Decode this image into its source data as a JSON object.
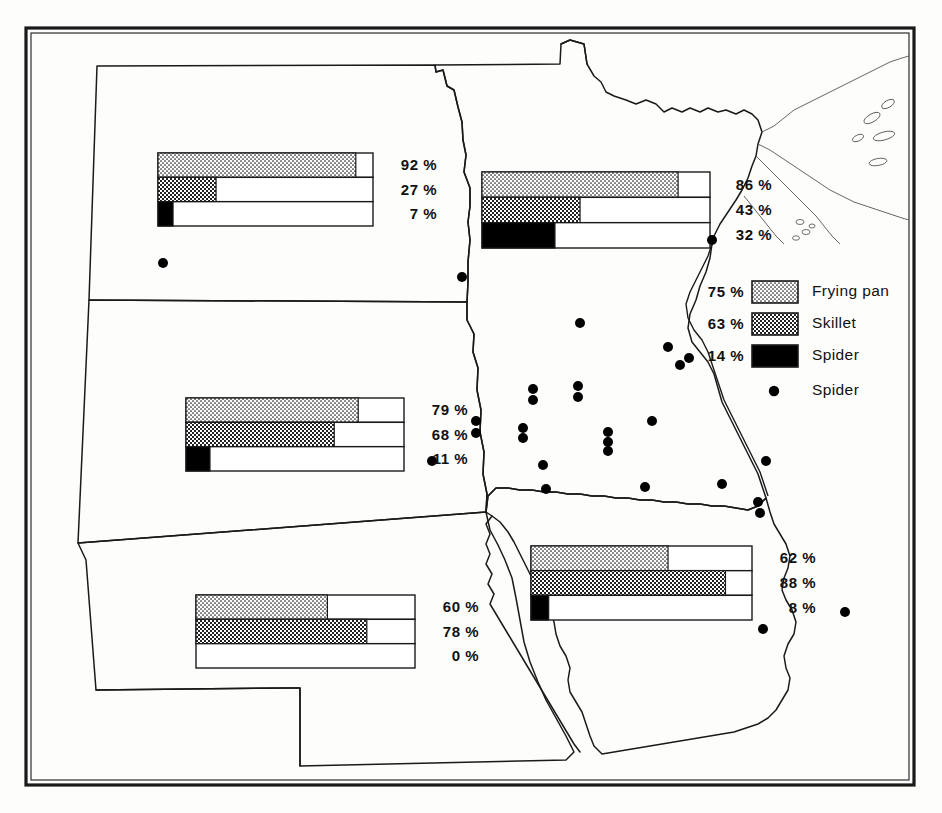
{
  "figure": {
    "kind": "linguistic-atlas-map",
    "region": "Upper Midwest",
    "frame": {
      "outer_color": "#1a1a1a",
      "inner_color": "#1a1a1a"
    }
  },
  "legend": {
    "swatches": [
      {
        "pct": "75 %",
        "label": "Frying pan",
        "pattern": "light-stipple",
        "color": "#111111"
      },
      {
        "pct": "63 %",
        "label": "Skillet",
        "pattern": "mid-checker",
        "color": "#111111"
      },
      {
        "pct": "14 %",
        "label": "Spider",
        "pattern": "solid-black",
        "color": "#000000"
      }
    ],
    "dot_entry": {
      "label": "Spider",
      "symbol": "dot"
    }
  },
  "chart_data": {
    "type": "bar",
    "series_names": [
      "Frying pan",
      "Skillet",
      "Spider"
    ],
    "units": "percent",
    "xlim": [
      0,
      100
    ],
    "groups": [
      {
        "name": "north-dakota",
        "values": [
          92,
          27,
          7
        ],
        "labels": [
          "92 %",
          "27 %",
          "7 %"
        ]
      },
      {
        "name": "minnesota",
        "values": [
          86,
          43,
          32
        ],
        "labels": [
          "86 %",
          "43 %",
          "32 %"
        ]
      },
      {
        "name": "south-dakota",
        "values": [
          79,
          68,
          11
        ],
        "labels": [
          "79 %",
          "68 %",
          "11 %"
        ]
      },
      {
        "name": "nebraska",
        "values": [
          60,
          78,
          0
        ],
        "labels": [
          "60 %",
          "78 %",
          "0 %"
        ]
      },
      {
        "name": "iowa",
        "values": [
          62,
          88,
          8
        ],
        "labels": [
          "62 %",
          "88 %",
          "8 %"
        ]
      }
    ],
    "legend_totals": {
      "values": [
        75,
        63,
        14
      ],
      "labels": [
        "75 %",
        "63 %",
        "14 %"
      ]
    },
    "legend_position": "right"
  },
  "bar_groups": [
    {
      "name": "north-dakota",
      "box": {
        "x": 158,
        "y": 153,
        "w": 215,
        "h": 73
      },
      "rows": [
        {
          "series": "Frying pan",
          "value": 92,
          "label": "92 %",
          "pattern": "light-stipple"
        },
        {
          "series": "Skillet",
          "value": 27,
          "label": "27 %",
          "pattern": "mid-checker"
        },
        {
          "series": "Spider",
          "value": 7,
          "label": "7 %",
          "pattern": "solid-black"
        }
      ],
      "label_x": 381,
      "label_y": 156
    },
    {
      "name": "minnesota",
      "box": {
        "x": 482,
        "y": 172,
        "w": 228,
        "h": 76
      },
      "rows": [
        {
          "series": "Frying pan",
          "value": 86,
          "label": "86 %",
          "pattern": "light-stipple"
        },
        {
          "series": "Skillet",
          "value": 43,
          "label": "43 %",
          "pattern": "mid-checker"
        },
        {
          "series": "Spider",
          "value": 32,
          "label": "32 %",
          "pattern": "solid-black"
        }
      ],
      "label_x": 716,
      "label_y": 175
    },
    {
      "name": "south-dakota",
      "box": {
        "x": 186,
        "y": 398,
        "w": 218,
        "h": 73
      },
      "rows": [
        {
          "series": "Frying pan",
          "value": 79,
          "label": "79 %",
          "pattern": "light-stipple"
        },
        {
          "series": "Skillet",
          "value": 68,
          "label": "68 %",
          "pattern": "mid-checker"
        },
        {
          "series": "Spider",
          "value": 11,
          "label": "11 %",
          "pattern": "solid-black"
        }
      ],
      "label_x": 412,
      "label_y": 401
    },
    {
      "name": "nebraska",
      "box": {
        "x": 196,
        "y": 595,
        "w": 219,
        "h": 73
      },
      "rows": [
        {
          "series": "Frying pan",
          "value": 60,
          "label": "60 %",
          "pattern": "light-stipple"
        },
        {
          "series": "Skillet",
          "value": 78,
          "label": "78 %",
          "pattern": "mid-checker"
        },
        {
          "series": "Spider",
          "value": 0,
          "label": "0 %",
          "pattern": "solid-black"
        }
      ],
      "label_x": 423,
      "label_y": 598
    },
    {
      "name": "iowa",
      "box": {
        "x": 531,
        "y": 546,
        "w": 221,
        "h": 74
      },
      "rows": [
        {
          "series": "Frying pan",
          "value": 62,
          "label": "62 %",
          "pattern": "light-stipple"
        },
        {
          "series": "Skillet",
          "value": 88,
          "label": "88 %",
          "pattern": "mid-checker"
        },
        {
          "series": "Spider",
          "value": 8,
          "label": "8 %",
          "pattern": "solid-black"
        }
      ],
      "label_x": 760,
      "label_y": 549
    }
  ],
  "spider_dots": [
    {
      "x": 163,
      "y": 263
    },
    {
      "x": 462,
      "y": 277
    },
    {
      "x": 712,
      "y": 240
    },
    {
      "x": 580,
      "y": 323
    },
    {
      "x": 668,
      "y": 347
    },
    {
      "x": 689,
      "y": 358
    },
    {
      "x": 680,
      "y": 365
    },
    {
      "x": 533,
      "y": 389
    },
    {
      "x": 533,
      "y": 400
    },
    {
      "x": 578,
      "y": 386
    },
    {
      "x": 578,
      "y": 397
    },
    {
      "x": 476,
      "y": 421
    },
    {
      "x": 476,
      "y": 433
    },
    {
      "x": 523,
      "y": 428
    },
    {
      "x": 523,
      "y": 438
    },
    {
      "x": 608,
      "y": 432
    },
    {
      "x": 608,
      "y": 442
    },
    {
      "x": 608,
      "y": 451
    },
    {
      "x": 652,
      "y": 421
    },
    {
      "x": 432,
      "y": 461
    },
    {
      "x": 543,
      "y": 465
    },
    {
      "x": 546,
      "y": 489
    },
    {
      "x": 645,
      "y": 487
    },
    {
      "x": 722,
      "y": 484
    },
    {
      "x": 766,
      "y": 461
    },
    {
      "x": 758,
      "y": 502
    },
    {
      "x": 760,
      "y": 513
    },
    {
      "x": 845,
      "y": 612
    },
    {
      "x": 763,
      "y": 629
    }
  ]
}
